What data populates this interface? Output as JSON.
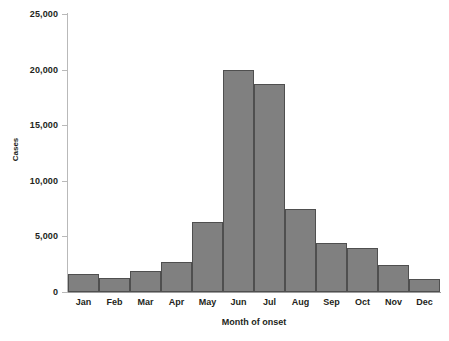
{
  "chart_data": {
    "type": "bar",
    "title": "",
    "xlabel": "Month of onset",
    "ylabel": "Cases",
    "categories": [
      "Jan",
      "Feb",
      "Mar",
      "Apr",
      "May",
      "Jun",
      "Jul",
      "Aug",
      "Sep",
      "Oct",
      "Nov",
      "Dec"
    ],
    "values": [
      1600,
      1300,
      1900,
      2700,
      6300,
      20000,
      18700,
      7500,
      4400,
      4000,
      2400,
      1200
    ],
    "ylim": [
      0,
      25000
    ],
    "y_ticks": [
      0,
      5000,
      10000,
      15000,
      20000,
      25000
    ],
    "y_tick_labels": [
      "0",
      "5,000",
      "10,000",
      "15,000",
      "20,000",
      "25,000"
    ],
    "grid": false,
    "legend": false,
    "bar_fill_color": "#808080",
    "bar_edge_color": "#4f4f4f",
    "axis_color": "#b9b9b9",
    "text_color": "#231f20"
  }
}
